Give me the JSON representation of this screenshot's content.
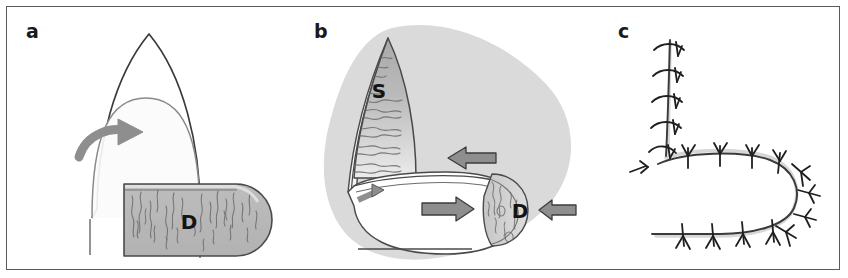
{
  "figure": {
    "background_color": "#ffffff",
    "frame_color": "#5b5b5b",
    "width": 848,
    "height": 278
  },
  "palette": {
    "ink": "#3a3a3a",
    "ink_dark": "#141414",
    "outline": "#4a4a4a",
    "tissue_gray": "#b4b4b4",
    "tissue_gray_light": "#d2d2d2",
    "tissue_gray_dark": "#9a9a9a",
    "halo_gray": "#d9d9d9",
    "arrow_fill": "#8e8e8e",
    "arrow_stroke": "#3c3c3c",
    "texture_stroke": "#6e6e6e",
    "white": "#ffffff"
  },
  "panels": [
    {
      "id": "a",
      "label": "a",
      "label_x": 20,
      "label_y": 22,
      "description": "Pointed gothic-arch tissue flap with inner rounded dome and a curved rotation arrow, adjoining a horizontal rounded-end lobe labelled D filled with vertical fibre texture.",
      "regions": [
        {
          "name": "D",
          "letter": "D",
          "x": 183,
          "y": 216
        }
      ],
      "arrows": [
        {
          "name": "rotation-arrow",
          "kind": "curved",
          "direction": "clockwise-right"
        }
      ]
    },
    {
      "id": "b",
      "label": "b",
      "label_x": 18,
      "label_y": 22,
      "description": "Pale gray background blob; pointed flap opened to show region S with horizontal wavy texture; lower white pouch with rounded right end enclosing region D; three block arrows plus one small arrow indicating direction of pull.",
      "regions": [
        {
          "name": "S",
          "letter": "S",
          "x": 83,
          "y": 85
        },
        {
          "name": "D",
          "letter": "D",
          "x": 224,
          "y": 213
        }
      ],
      "arrows": [
        {
          "name": "upper-left-block-arrow",
          "kind": "block",
          "direction": "left"
        },
        {
          "name": "lower-right-block-arrow",
          "kind": "block",
          "direction": "right"
        },
        {
          "name": "far-right-block-arrow",
          "kind": "block",
          "direction": "left"
        },
        {
          "name": "small-upper-left-arrow",
          "kind": "small",
          "direction": "up-right"
        }
      ]
    },
    {
      "id": "c",
      "label": "c",
      "label_x": 22,
      "label_y": 22,
      "description": "Completed closure: a vertical suture line meeting a horizontal U-shaped (horseshoe) suture line, with interrupted stitch marks along its whole length.",
      "regions": [],
      "arrows": [],
      "suture": {
        "stitch_count_vertical": 5,
        "stitch_count_upper_horizontal": 4,
        "stitch_count_curve": 4,
        "stitch_count_lower_horizontal": 4
      }
    }
  ]
}
